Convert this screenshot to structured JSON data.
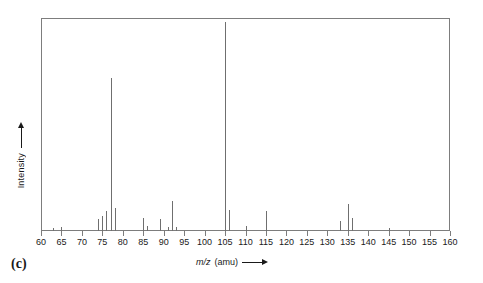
{
  "figure": {
    "panel_label": "(c)",
    "frame_color": "#7d7d7d",
    "peak_color": "#6f6f6f"
  },
  "axes": {
    "x_title_symbol": "m/z",
    "x_title_units": "(amu)",
    "x_arrow": "arrow-right",
    "y_title": "Intensity",
    "y_arrow": "arrow-up"
  },
  "chart_data": {
    "type": "bar",
    "title": "",
    "subtitle": "",
    "xlabel": "m/z (amu)",
    "ylabel": "Intensity",
    "xlim": [
      60,
      160
    ],
    "ylim": [
      0,
      100
    ],
    "grid": false,
    "legend": null,
    "annotations": [
      "(c)"
    ],
    "x_major_ticks": [
      60,
      65,
      70,
      75,
      80,
      85,
      90,
      95,
      100,
      105,
      110,
      115,
      120,
      125,
      130,
      135,
      140,
      145,
      150,
      155,
      160
    ],
    "x_tick_labels": [
      "60",
      "65",
      "70",
      "75",
      "80",
      "85",
      "90",
      "95",
      "100",
      "105",
      "110",
      "115",
      "120",
      "125",
      "130",
      "135",
      "140",
      "145",
      "150",
      "155",
      "160"
    ],
    "y_tick_labels": [],
    "base_peak_mz": 105,
    "series": [
      {
        "name": "mass spectrum",
        "x": [
          63,
          65,
          74,
          75,
          76,
          77,
          78,
          85,
          86,
          89,
          91,
          92,
          93,
          105,
          106,
          110,
          115,
          133,
          135,
          136,
          145
        ],
        "values": [
          1.5,
          2.0,
          5.5,
          7.0,
          9.5,
          72.0,
          11.0,
          6.0,
          2.5,
          5.5,
          2.0,
          14.0,
          2.0,
          98.0,
          10.0,
          2.5,
          9.5,
          4.5,
          12.5,
          6.0,
          1.5
        ]
      }
    ]
  }
}
